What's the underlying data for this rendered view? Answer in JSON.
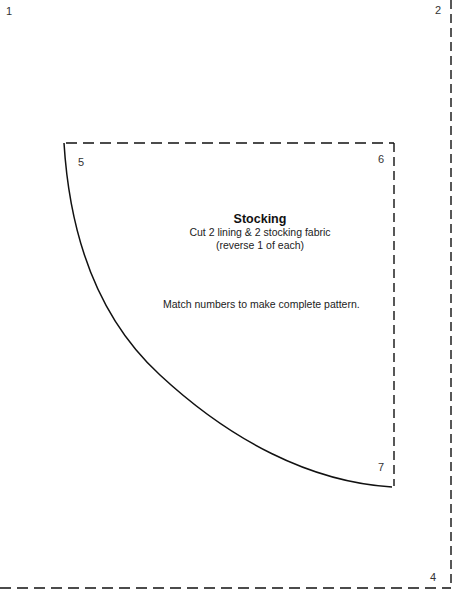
{
  "page_numbers": {
    "top_left": "1",
    "top_right": "2",
    "bottom_right": "4"
  },
  "pattern_piece": {
    "corner_labels": {
      "top_left": "5",
      "top_right": "6",
      "bottom_right": "7"
    },
    "title": "Stocking",
    "instructions": [
      "Cut 2 lining & 2 stocking fabric",
      "(reverse 1 of each)"
    ],
    "note": "Match numbers to make complete pattern."
  },
  "colors": {
    "line": "#111111",
    "background": "#ffffff"
  }
}
